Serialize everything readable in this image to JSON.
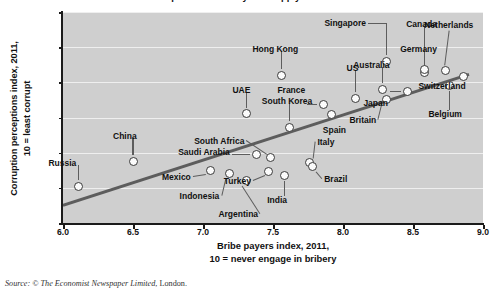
{
  "source_note": {
    "prefix": "Source: © ",
    "italic": "The Economist Newspaper Limited",
    "suffix": ", London."
  },
  "title_clipped": "Corruption and bribery: the supply and demand of sleaze",
  "chart_data": {
    "type": "scatter",
    "title": "",
    "xlabel": "Bribe payers index, 2011,\n10 = never engage in bribery",
    "ylabel": "Corruption perceptions index, 2011,\n10 = least corrupt",
    "xlim": [
      6.0,
      9.0
    ],
    "ylim": [
      0,
      12
    ],
    "xticks": [
      "6.0",
      "6.5",
      "7.0",
      "7.5",
      "8.0",
      "8.5",
      "9.0"
    ],
    "xtick_values": [
      6.0,
      6.5,
      7.0,
      7.5,
      8.0,
      8.5,
      9.0
    ],
    "yticks": [
      "0",
      "2",
      "4",
      "6",
      "8",
      "10",
      "12"
    ],
    "ytick_values": [
      0,
      2,
      4,
      6,
      8,
      10,
      12
    ],
    "grid": "horizontal",
    "legend": "none",
    "plot_background": "#cfcfcf",
    "point_fill": "#fbfbfb",
    "point_stroke": "#3a3a3a",
    "trendline_color": "#5d5d5d",
    "trendline": {
      "x0": 6.0,
      "y0": 1.0,
      "x1": 8.9,
      "y1": 8.45
    },
    "points": [
      {
        "name": "Russia",
        "x": 6.11,
        "y": 2.1,
        "lx": -30,
        "ly": -23,
        "leader": "v"
      },
      {
        "name": "China",
        "x": 6.5,
        "y": 3.5,
        "lx": -20,
        "ly": -25,
        "leader": "v"
      },
      {
        "name": "Mexico",
        "x": 7.05,
        "y": 3.0,
        "lx": -48,
        "ly": 7,
        "leader": "d-left"
      },
      {
        "name": "Indonesia",
        "x": 7.19,
        "y": 2.8,
        "lx": -50,
        "ly": 22,
        "leader": "d-left"
      },
      {
        "name": "Saudi Arabia",
        "x": 7.38,
        "y": 3.9,
        "lx": -78,
        "ly": -2,
        "leader": "h-left"
      },
      {
        "name": "South Africa",
        "x": 7.48,
        "y": 3.75,
        "lx": -76,
        "ly": -16,
        "leader": "d-left2"
      },
      {
        "name": "Turkey",
        "x": 7.47,
        "y": 2.95,
        "lx": -45,
        "ly": 10,
        "leader": "d-left"
      },
      {
        "name": "India",
        "x": 7.58,
        "y": 2.7,
        "lx": -17,
        "ly": 24,
        "leader": "v"
      },
      {
        "name": "Argentina",
        "x": 7.31,
        "y": 2.4,
        "lx": -28,
        "ly": 33,
        "leader": "d-left"
      },
      {
        "name": "Italy",
        "x": 7.76,
        "y": 3.45,
        "lx": 8,
        "ly": -20,
        "leader": "d-right"
      },
      {
        "name": "Brazil",
        "x": 7.78,
        "y": 3.2,
        "lx": 12,
        "ly": 12,
        "leader": "d-right"
      },
      {
        "name": "South Korea",
        "x": 7.62,
        "y": 5.45,
        "lx": -28,
        "ly": -26,
        "leader": "v"
      },
      {
        "name": "UAE",
        "x": 7.31,
        "y": 6.2,
        "lx": -14,
        "ly": -24,
        "leader": "v"
      },
      {
        "name": "Hong Kong",
        "x": 7.56,
        "y": 8.4,
        "lx": -29,
        "ly": -26,
        "leader": "v"
      },
      {
        "name": "France",
        "x": 7.86,
        "y": 6.75,
        "lx": -46,
        "ly": -14,
        "leader": "h-left"
      },
      {
        "name": "Spain",
        "x": 7.92,
        "y": 6.15,
        "lx": -9,
        "ly": 15,
        "leader": "none"
      },
      {
        "name": "US",
        "x": 8.09,
        "y": 7.1,
        "lx": -9,
        "ly": -30,
        "leader": "v"
      },
      {
        "name": "Australia",
        "x": 8.28,
        "y": 7.6,
        "lx": -29,
        "ly": -24,
        "leader": "v"
      },
      {
        "name": "Britain",
        "x": 8.31,
        "y": 7.05,
        "lx": -37,
        "ly": 21,
        "leader": "d-left"
      },
      {
        "name": "Japan",
        "x": 8.46,
        "y": 7.5,
        "lx": -44,
        "ly": 12,
        "leader": "h-left"
      },
      {
        "name": "Singapore",
        "x": 8.31,
        "y": 9.2,
        "lx": -62,
        "ly": -38,
        "leader": "l-left"
      },
      {
        "name": "Germany",
        "x": 8.58,
        "y": 8.55,
        "lx": -24,
        "ly": -24,
        "leader": "v"
      },
      {
        "name": "Canada",
        "x": 8.58,
        "y": 8.75,
        "lx": -18,
        "ly": -45,
        "leader": "v2"
      },
      {
        "name": "Netherlands",
        "x": 8.73,
        "y": 8.7,
        "lx": -21,
        "ly": -45,
        "leader": "d-left3"
      },
      {
        "name": "Switzerland",
        "x": 8.86,
        "y": 8.35,
        "lx": -45,
        "ly": 10,
        "leader": "none"
      },
      {
        "name": "Belgium",
        "x": 8.76,
        "y": 7.8,
        "lx": -21,
        "ly": 28,
        "leader": "v"
      }
    ]
  }
}
